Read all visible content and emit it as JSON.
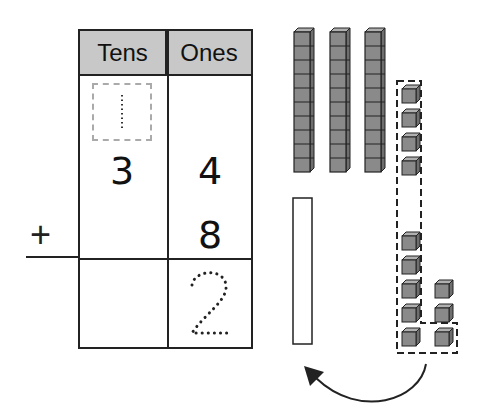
{
  "table": {
    "headers": {
      "tens": "Tens",
      "ones": "Ones"
    },
    "carry": {
      "tens": "1"
    },
    "addend1": {
      "tens": "3",
      "ones": "4"
    },
    "addend2": {
      "ones": "8"
    },
    "operator": "+",
    "sum": {
      "tens": "",
      "ones": "2"
    }
  },
  "blocks": {
    "tens_rods": 3,
    "ones_top_group": 4,
    "ones_bottom_left": 5,
    "ones_bottom_right": 3,
    "empty_rod_outline": true,
    "arrow": "regroup-ten-ones-to-rod"
  },
  "colors": {
    "block_fill": "#8a8a8a",
    "header_fill": "#c8c8c8",
    "line": "#222222"
  }
}
